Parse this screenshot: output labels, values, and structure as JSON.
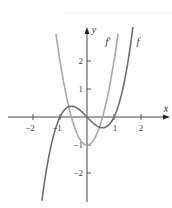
{
  "chart_data": {
    "type": "line",
    "title": "",
    "xlabel": "x",
    "ylabel": "y",
    "xlim": [
      -2.9,
      3.1
    ],
    "ylim": [
      -3.1,
      3.2
    ],
    "grid": false,
    "x_ticks": [
      -2,
      -1,
      1,
      2
    ],
    "y_ticks": [
      -2,
      -1,
      1,
      2
    ],
    "x_tick_labels": [
      "−2",
      "−1",
      "1",
      "2"
    ],
    "y_tick_labels": [
      "−2",
      "−1",
      "1",
      "2"
    ],
    "series": [
      {
        "name": "f",
        "label": "f",
        "expression": "x^3 - x",
        "color": "#6e6e6e",
        "x": [
          -1.67,
          -1.5,
          -1.25,
          -1,
          -0.75,
          -0.577,
          -0.5,
          -0.25,
          0,
          0.25,
          0.5,
          0.577,
          0.75,
          1,
          1.25,
          1.5,
          1.7
        ],
        "y": [
          -2.99,
          -1.875,
          -0.703,
          0,
          0.328,
          0.385,
          0.375,
          0.234,
          0,
          -0.234,
          -0.375,
          -0.385,
          -0.328,
          0,
          0.703,
          1.875,
          3.21
        ]
      },
      {
        "name": "f'",
        "label": "f′",
        "expression": "3x^2 - 1",
        "color": "#a8a8a8",
        "x": [
          -1.15,
          -1,
          -0.75,
          -0.577,
          -0.5,
          -0.25,
          0,
          0.25,
          0.5,
          0.577,
          0.75,
          1,
          1.15
        ],
        "y": [
          2.97,
          2,
          0.6875,
          0,
          -0.25,
          -0.8125,
          -1,
          -0.8125,
          -0.25,
          0,
          0.6875,
          2,
          2.97
        ]
      }
    ],
    "annotations": [
      {
        "text": "f′",
        "near": "right branch of f′ near top"
      },
      {
        "text": "f",
        "near": "right branch of f near top"
      }
    ]
  },
  "labels": {
    "x_axis": "x",
    "y_axis": "y",
    "f_prime": "f′",
    "f": "f",
    "tick_x_m2": "−2",
    "tick_x_m1": "−1",
    "tick_x_1": "1",
    "tick_x_2": "2",
    "tick_y_2": "2",
    "tick_y_1": "1",
    "tick_y_m1": "−1",
    "tick_y_m2": "−2"
  }
}
